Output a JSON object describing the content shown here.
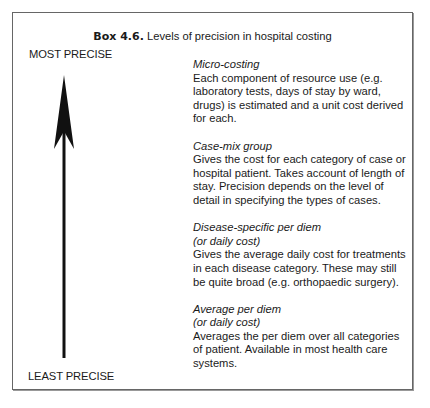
{
  "box": {
    "title_bold": "Box 4.6.",
    "title_text": " Levels of precision in hospital costing",
    "scale": {
      "top_label": "MOST PRECISE",
      "bottom_label": "LEAST PRECISE",
      "arrow_direction": "up"
    },
    "entries": [
      {
        "name": "Micro-costing",
        "subtitle": "",
        "description": "Each component of resource use (e.g. laboratory tests, days of stay by ward, drugs) is estimated and a unit cost derived for each."
      },
      {
        "name": "Case-mix group",
        "subtitle": "",
        "description": "Gives the cost for each category of case or hospital patient. Takes account of length of stay. Precision depends on the level of detail in specifying the types of cases."
      },
      {
        "name": "Disease-specific per diem",
        "subtitle": "(or daily cost)",
        "description": "Gives the average daily cost for treatments in each disease category. These may still be quite broad (e.g. orthopaedic surgery)."
      },
      {
        "name": "Average per diem",
        "subtitle": "(or daily cost)",
        "description": "Averages the per diem over all categories of patient. Available in most health care systems."
      }
    ]
  }
}
